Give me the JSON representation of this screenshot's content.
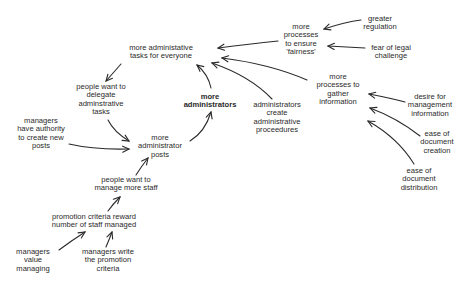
{
  "diagram": {
    "type": "causal-loop",
    "nodes": [
      {
        "id": "tasks",
        "lines": [
          "more administative",
          "tasks for everyone"
        ],
        "x": 161,
        "y": 52,
        "bold": false
      },
      {
        "id": "fairness",
        "lines": [
          "more",
          "processes",
          "to ensure",
          "'fairness'"
        ],
        "x": 301,
        "y": 40,
        "bold": false
      },
      {
        "id": "regulation",
        "lines": [
          "greater",
          "regulation"
        ],
        "x": 380,
        "y": 23,
        "bold": false
      },
      {
        "id": "legal",
        "lines": [
          "fear of legal",
          "challenge"
        ],
        "x": 391,
        "y": 52,
        "bold": false
      },
      {
        "id": "delegate",
        "lines": [
          "people want to",
          "delegate",
          "adminstrative",
          "tasks"
        ],
        "x": 101,
        "y": 100,
        "bold": false
      },
      {
        "id": "administrators",
        "lines": [
          "more",
          "administrators"
        ],
        "x": 210,
        "y": 101,
        "bold": true
      },
      {
        "id": "procedures",
        "lines": [
          "administrators",
          "create",
          "administrative",
          "proceedures"
        ],
        "x": 277,
        "y": 118,
        "bold": false
      },
      {
        "id": "gather",
        "lines": [
          "more",
          "processes to",
          "gather",
          "information"
        ],
        "x": 338,
        "y": 90,
        "bold": false
      },
      {
        "id": "desire",
        "lines": [
          "desire for",
          "management",
          "information"
        ],
        "x": 430,
        "y": 106,
        "bold": false
      },
      {
        "id": "creation",
        "lines": [
          "ease of",
          "document",
          "creation"
        ],
        "x": 437,
        "y": 143,
        "bold": false
      },
      {
        "id": "distribution",
        "lines": [
          "ease of",
          "document",
          "distribution"
        ],
        "x": 419,
        "y": 180,
        "bold": false
      },
      {
        "id": "authority",
        "lines": [
          "managers",
          "have authority",
          "to create new",
          "posts"
        ],
        "x": 41,
        "y": 134,
        "bold": false
      },
      {
        "id": "posts",
        "lines": [
          "more",
          "administrator",
          "posts"
        ],
        "x": 160,
        "y": 147,
        "bold": false
      },
      {
        "id": "staff",
        "lines": [
          "people want to",
          "manage more staff"
        ],
        "x": 126,
        "y": 184,
        "bold": false
      },
      {
        "id": "promotion",
        "lines": [
          "promotion criteria reward",
          "number of staff managed"
        ],
        "x": 94,
        "y": 221,
        "bold": false
      },
      {
        "id": "value",
        "lines": [
          "managers",
          "value",
          "managing"
        ],
        "x": 33,
        "y": 261,
        "bold": false
      },
      {
        "id": "write",
        "lines": [
          "managers write",
          "the promotion",
          "criteria"
        ],
        "x": 108,
        "y": 261,
        "bold": false
      }
    ],
    "edges": [
      {
        "from": "regulation",
        "to": "fairness",
        "path": "M 361 20 Q 345 22 324 29",
        "head": [
          324,
          29
        ]
      },
      {
        "from": "legal",
        "to": "fairness",
        "path": "M 365 48 Q 345 47 328 46",
        "head": [
          328,
          46
        ]
      },
      {
        "from": "fairness",
        "to": "tasks",
        "path": "M 278 41 Q 250 44 218 48",
        "head": [
          218,
          48
        ]
      },
      {
        "from": "gather",
        "to": "tasks",
        "path": "M 307 80 Q 270 64 222 58",
        "head": [
          222,
          58
        ]
      },
      {
        "from": "procedures",
        "to": "tasks",
        "path": "M 272 99 Q 250 76 212 63",
        "head": [
          212,
          63
        ]
      },
      {
        "from": "administrators",
        "to": "tasks",
        "path": "M 211 88 Q 208 74 197 65",
        "head": [
          197,
          65
        ]
      },
      {
        "from": "tasks",
        "to": "delegate",
        "path": "M 121 64 Q 114 72 106 81",
        "head": [
          106,
          81
        ]
      },
      {
        "from": "delegate",
        "to": "posts",
        "path": "M 108 120 Q 114 132 129 141",
        "head": [
          129,
          141
        ]
      },
      {
        "from": "authority",
        "to": "posts",
        "path": "M 69 144 Q 95 150 129 149",
        "head": [
          129,
          149
        ]
      },
      {
        "from": "posts",
        "to": "administrators",
        "path": "M 190 141 Q 205 132 211 112",
        "head": [
          211,
          112
        ]
      },
      {
        "from": "staff",
        "to": "posts",
        "path": "M 136 175 Q 141 167 148 158",
        "head": [
          148,
          158
        ]
      },
      {
        "from": "promotion",
        "to": "staff",
        "path": "M 108 211 Q 113 204 120 197",
        "head": [
          120,
          197
        ]
      },
      {
        "from": "value",
        "to": "promotion",
        "path": "M 59 250 Q 71 241 85 232",
        "head": [
          85,
          232
        ]
      },
      {
        "from": "write",
        "to": "promotion",
        "path": "M 106 247 Q 109 240 112 232",
        "head": [
          112,
          232
        ]
      },
      {
        "from": "desire",
        "to": "gather",
        "path": "M 405 102 Q 390 98 369 94",
        "head": [
          369,
          94
        ]
      },
      {
        "from": "creation",
        "to": "gather",
        "path": "M 420 136 Q 397 118 370 108",
        "head": [
          370,
          108
        ]
      },
      {
        "from": "distribution",
        "to": "gather",
        "path": "M 414 164 Q 398 138 368 121",
        "head": [
          368,
          121
        ]
      }
    ]
  }
}
